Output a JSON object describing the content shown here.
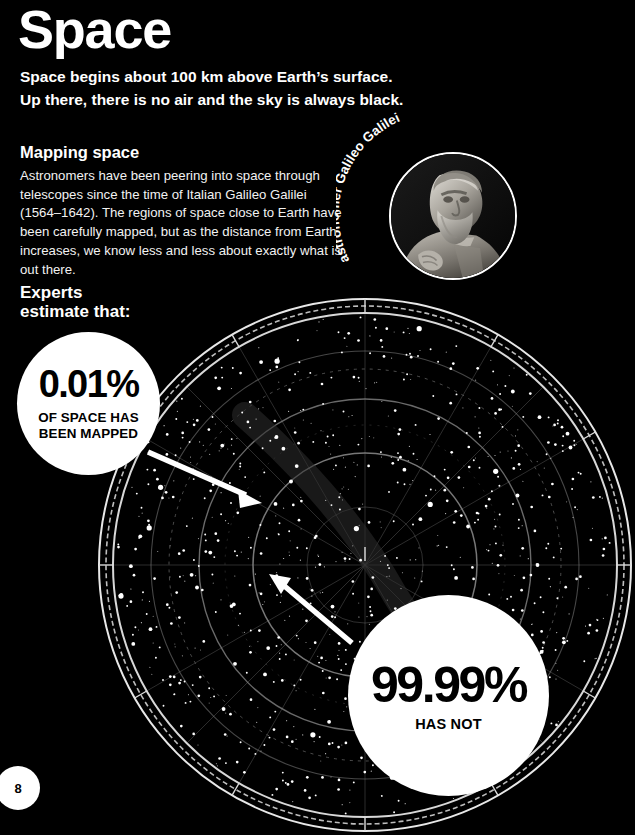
{
  "page": {
    "title": "Space",
    "subtitle": "Space begins about 100 km above Earth’s surface.\nUp there, there is no air and the sky is always black.",
    "page_number": "8",
    "background_color": "#000000",
    "text_color": "#ffffff"
  },
  "section": {
    "heading": "Mapping space",
    "body": "Astronomers have been peering into space through telescopes since the time of Italian Galileo Galilei (1564–1642). The regions of space close to Earth have been carefully mapped, but as the distance from Earth increases, we know less and less about exactly what is out there.",
    "lead_in": "Experts\nestimate that:"
  },
  "portrait": {
    "caption": "astronomer Galileo Galilei",
    "subject": "marble statue bust of Galileo Galilei",
    "frame": "circular white-outlined photo"
  },
  "stats": [
    {
      "id": "mapped",
      "value": "0.01%",
      "label": "OF SPACE HAS\nBEEN MAPPED",
      "bubble_color": "#ffffff",
      "text_color": "#000000"
    },
    {
      "id": "not-mapped",
      "value": "99.99%",
      "label": "HAS NOT",
      "bubble_color": "#ffffff",
      "text_color": "#000000"
    }
  ],
  "chart_data": {
    "type": "scatter",
    "projection": "polar",
    "center": [
      365,
      565
    ],
    "outer_radius": 270,
    "rings": [
      60,
      110,
      165,
      218,
      255,
      262,
      270
    ],
    "radial_lines": 12,
    "star_count": 900,
    "grid": true,
    "legend": false,
    "star_color": "#ffffff",
    "grid_color": "#9a9a9a",
    "background": "#000000"
  },
  "annotations": [
    {
      "id": "arrow-mapped",
      "points_to": "inner mapped region",
      "from": [
        150,
        455
      ],
      "to": [
        258,
        502
      ]
    },
    {
      "id": "arrow-not-mapped",
      "points_to": "outer unmapped region",
      "from": [
        352,
        645
      ],
      "to": [
        272,
        578
      ]
    }
  ],
  "icons": {
    "page_badge": "page-number-badge"
  }
}
